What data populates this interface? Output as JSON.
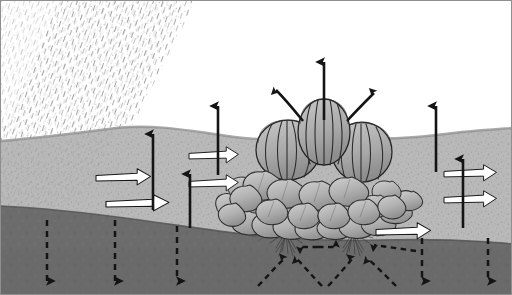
{
  "figure": {
    "type": "cross-section-diagram",
    "width": 512,
    "height": 295
  },
  "palette": {
    "sky": "#ffffff",
    "rain_hatch": "#9a9a9a",
    "topsoil": "#b9b9b9",
    "topsoil_dark": "#a8a8a8",
    "topsoil_shaded": "#aeaeae",
    "subsoil": "#6c6c6c",
    "subsoil_shadow": "#606060",
    "plant_fill": "#b0b0b0",
    "plant_light": "#c6c6c6",
    "plant_dark": "#8e8e8e",
    "outline": "#1a1a1a",
    "white_arrow_fill": "#ffffff",
    "black_arrow": "#141414",
    "root": "#3a3a3a",
    "border": "#8c8c8c"
  },
  "layers": [
    {
      "name": "sky",
      "label": "Atmosphere"
    },
    {
      "name": "rainfall",
      "label": "Rainfall"
    },
    {
      "name": "topsoil",
      "label": "Topsoil"
    },
    {
      "name": "subsoil",
      "label": "Subsoil"
    }
  ],
  "rainfall": {
    "name": "rain-hatching",
    "label": "Rainfall / precipitation hatching",
    "direction": "diagonal",
    "coverage": "upper-left"
  },
  "plants": {
    "label": "Cabbage crop row",
    "count": 3,
    "heads": [
      {
        "id": "head-left",
        "cx": 288,
        "cy": 148,
        "rx": 32,
        "ry": 31
      },
      {
        "id": "head-center",
        "cx": 323,
        "cy": 131,
        "rx": 27,
        "ry": 33
      },
      {
        "id": "head-right",
        "cx": 362,
        "cy": 150,
        "rx": 30,
        "ry": 31
      }
    ],
    "roots": [
      {
        "id": "root-left",
        "x": 285,
        "y": 234
      },
      {
        "id": "root-right",
        "x": 352,
        "y": 234
      }
    ]
  },
  "arrows": {
    "evaporation": {
      "label": "Evaporation from soil surface (solid black, upward)",
      "style": "solid-black-up",
      "items": [
        {
          "id": "evap-1",
          "x": 153,
          "y_top": 128,
          "y_bottom": 210
        },
        {
          "id": "evap-2",
          "x": 190,
          "y_top": 168,
          "y_bottom": 228
        },
        {
          "id": "evap-3",
          "x": 218,
          "y_top": 100,
          "y_bottom": 175
        },
        {
          "id": "evap-4",
          "x": 436,
          "y_top": 100,
          "y_bottom": 172
        },
        {
          "id": "evap-5",
          "x": 463,
          "y_top": 153,
          "y_bottom": 228
        }
      ]
    },
    "transpiration": {
      "label": "Transpiration from canopy (solid black, upward & curved)",
      "style": "solid-black",
      "items": [
        {
          "id": "transp-center",
          "type": "straight",
          "x": 323,
          "y_top": 56,
          "y_bottom": 120
        },
        {
          "id": "transp-left",
          "type": "curved",
          "from": [
            302,
            122
          ],
          "to": [
            272,
            84
          ]
        },
        {
          "id": "transp-right",
          "type": "curved",
          "from": [
            348,
            122
          ],
          "to": [
            378,
            88
          ]
        }
      ]
    },
    "infiltration_lateral": {
      "label": "Lateral water movement in topsoil (white outlined, rightward)",
      "style": "white-outline-right",
      "items": [
        {
          "id": "lat-1",
          "x": 100,
          "y": 176,
          "w": 52
        },
        {
          "id": "lat-2",
          "x": 110,
          "y": 202,
          "w": 60
        },
        {
          "id": "lat-3",
          "x": 193,
          "y": 154,
          "w": 47
        },
        {
          "id": "lat-4",
          "x": 193,
          "y": 182,
          "w": 47
        },
        {
          "id": "lat-5",
          "x": 380,
          "y": 230,
          "w": 52
        },
        {
          "id": "lat-6",
          "x": 448,
          "y": 172,
          "w": 50
        },
        {
          "id": "lat-7",
          "x": 448,
          "y": 198,
          "w": 50
        }
      ]
    },
    "drainage": {
      "label": "Deep drainage / percolation (dashed black, downward)",
      "style": "dashed-black-down",
      "items": [
        {
          "id": "drain-1",
          "x": 47,
          "y_top": 222,
          "y_bottom": 288
        },
        {
          "id": "drain-2",
          "x": 115,
          "y_top": 222,
          "y_bottom": 288
        },
        {
          "id": "drain-3",
          "x": 177,
          "y_top": 228,
          "y_bottom": 288
        },
        {
          "id": "drain-4",
          "x": 422,
          "y_top": 240,
          "y_bottom": 288
        },
        {
          "id": "drain-5",
          "x": 488,
          "y_top": 240,
          "y_bottom": 288
        }
      ]
    },
    "root_uptake": {
      "label": "Soil water movement toward roots (dashed black)",
      "style": "dashed-black",
      "items": [
        {
          "id": "uptake-a",
          "type": "double-horizontal",
          "x1": 300,
          "x2": 336,
          "y": 247
        },
        {
          "id": "uptake-b",
          "type": "straight",
          "from": [
            414,
            250
          ],
          "to": [
            372,
            244
          ]
        },
        {
          "id": "uptake-c",
          "type": "curved",
          "from": [
            262,
            288
          ],
          "to": [
            284,
            258
          ]
        },
        {
          "id": "uptake-d",
          "type": "curved",
          "from": [
            318,
            288
          ],
          "to": [
            296,
            258
          ]
        },
        {
          "id": "uptake-e",
          "type": "curved",
          "from": [
            330,
            288
          ],
          "to": [
            352,
            258
          ]
        },
        {
          "id": "uptake-f",
          "type": "curved",
          "from": [
            394,
            288
          ],
          "to": [
            366,
            258
          ]
        }
      ]
    }
  }
}
